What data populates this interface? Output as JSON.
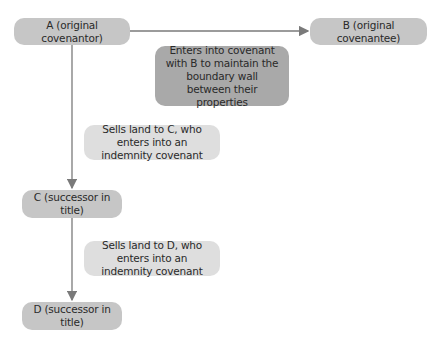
{
  "diagram": {
    "nodes": {
      "a": "A (original covenantor)",
      "b": "B (original covenantee)",
      "covenant_note": "Enters into covenant with B to maintain the boundary wall between their properties",
      "sale_c_note": "Sells land to C, who enters into an indemnity covenant",
      "c": "C (successor in title)",
      "sale_d_note": "Sells land to D, who enters into an indemnity covenant",
      "d": "D (successor in title)"
    },
    "edges": [
      {
        "from": "a",
        "to": "b",
        "label": "covenant_note"
      },
      {
        "from": "a",
        "to": "c",
        "label": "sale_c_note"
      },
      {
        "from": "c",
        "to": "d",
        "label": "sale_d_note"
      }
    ],
    "colors": {
      "party_box": "#c6c6c6",
      "covenant_box": "#a9a9a9",
      "sale_box": "#dedede",
      "connector": "#7a7a7a"
    }
  }
}
